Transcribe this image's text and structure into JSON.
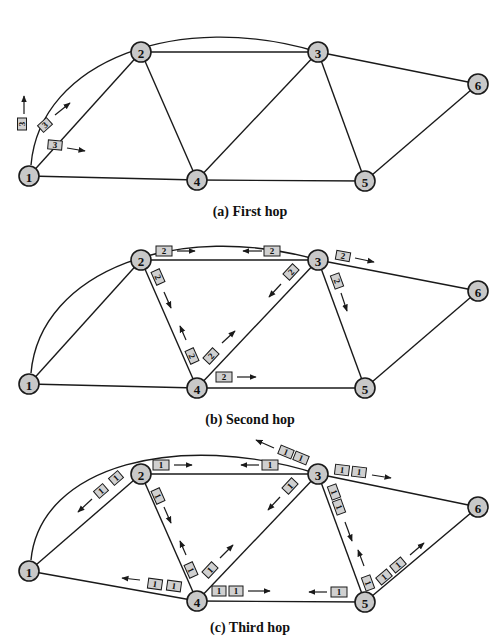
{
  "panels": [
    {
      "id": "a",
      "caption": "(a) First hop",
      "nodes": [
        {
          "id": "1",
          "x": 29,
          "y": 176
        },
        {
          "id": "2",
          "x": 141,
          "y": 52
        },
        {
          "id": "3",
          "x": 318,
          "y": 52
        },
        {
          "id": "4",
          "x": 197,
          "y": 180
        },
        {
          "id": "5",
          "x": 365,
          "y": 181
        },
        {
          "id": "6",
          "x": 478,
          "y": 84
        }
      ],
      "packets": [
        {
          "label": "3",
          "link": "1-3 (arc)",
          "count": 1
        },
        {
          "label": "3",
          "link": "1-2",
          "count": 1
        },
        {
          "label": "3",
          "link": "1-4",
          "count": 1
        }
      ]
    },
    {
      "id": "b",
      "caption": "(b) Second hop",
      "nodes": [
        {
          "id": "1",
          "x": 29,
          "y": 384
        },
        {
          "id": "2",
          "x": 141,
          "y": 260
        },
        {
          "id": "3",
          "x": 318,
          "y": 260
        },
        {
          "id": "4",
          "x": 197,
          "y": 388
        },
        {
          "id": "5",
          "x": 365,
          "y": 388
        },
        {
          "id": "6",
          "x": 478,
          "y": 291
        }
      ],
      "packets": [
        {
          "label": "2",
          "link": "2-3",
          "count": 1
        },
        {
          "label": "2",
          "link": "3-2",
          "count": 1
        },
        {
          "label": "2",
          "link": "2-4",
          "count": 1
        },
        {
          "label": "2",
          "link": "4-2",
          "count": 1
        },
        {
          "label": "2",
          "link": "4-3",
          "count": 1
        },
        {
          "label": "2",
          "link": "3-4",
          "count": 1
        },
        {
          "label": "2",
          "link": "4-5",
          "count": 1
        },
        {
          "label": "2",
          "link": "3-6",
          "count": 1
        },
        {
          "label": "2",
          "link": "3-5",
          "count": 1
        }
      ]
    },
    {
      "id": "c",
      "caption": "(c) Third hop",
      "nodes": [
        {
          "id": "1",
          "x": 29,
          "y": 571
        },
        {
          "id": "2",
          "x": 141,
          "y": 474
        },
        {
          "id": "3",
          "x": 318,
          "y": 474
        },
        {
          "id": "4",
          "x": 197,
          "y": 601
        },
        {
          "id": "5",
          "x": 365,
          "y": 602
        },
        {
          "id": "6",
          "x": 478,
          "y": 507
        }
      ],
      "packets": [
        {
          "label": "1",
          "link": "2-3",
          "count": 1
        },
        {
          "label": "1",
          "link": "3-2",
          "count": 1
        },
        {
          "label": "1",
          "link": "2-1",
          "count": 2
        },
        {
          "label": "1",
          "link": "2-4",
          "count": 1
        },
        {
          "label": "1",
          "link": "4-2",
          "count": 1
        },
        {
          "label": "1",
          "link": "4-3",
          "count": 1
        },
        {
          "label": "1",
          "link": "3-4",
          "count": 1
        },
        {
          "label": "1",
          "link": "4-1",
          "count": 2
        },
        {
          "label": "1",
          "link": "4-5",
          "count": 2
        },
        {
          "label": "1",
          "link": "5-4",
          "count": 1
        },
        {
          "label": "1",
          "link": "3-1 (arc)",
          "count": 2
        },
        {
          "label": "1",
          "link": "3-6",
          "count": 2
        },
        {
          "label": "1",
          "link": "3-5",
          "count": 2
        },
        {
          "label": "1",
          "link": "5-3",
          "count": 1
        },
        {
          "label": "1",
          "link": "5-6",
          "count": 2
        }
      ]
    }
  ],
  "labels": {
    "n1": "1",
    "n2": "2",
    "n3": "3",
    "n4": "4",
    "n5": "5",
    "n6": "6",
    "p3": "3",
    "p2": "2",
    "p1": "1",
    "cap_a": "(a) First hop",
    "cap_b": "(b) Second hop",
    "cap_c": "(c) Third hop"
  }
}
